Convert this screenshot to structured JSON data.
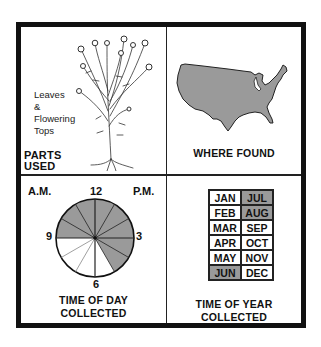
{
  "panels": {
    "parts_used": {
      "title_line1": "PARTS",
      "title_line2": "USED",
      "parts_line1": "Leaves",
      "parts_line2": "&",
      "parts_line3": "Flowering",
      "parts_line4": "Tops",
      "illustration": "flowering-plant-with-roots"
    },
    "where_found": {
      "title": "WHERE FOUND",
      "map": "contiguous-united-states",
      "map_fill": "#9a9a9a"
    },
    "time_of_day": {
      "title_line1": "TIME OF DAY",
      "title_line2": "COLLECTED",
      "am_label": "A.M.",
      "pm_label": "P.M.",
      "clock_labels": {
        "top": "12",
        "right": "3",
        "bottom": "6",
        "left": "9"
      },
      "shaded_from_hour": 9,
      "shaded_to_hour": 17,
      "shade_color": "#9a9a9a"
    },
    "time_of_year": {
      "title_line1": "TIME OF YEAR",
      "title_line2": "COLLECTED",
      "months": [
        {
          "label": "JAN",
          "shaded": false
        },
        {
          "label": "JUL",
          "shaded": true
        },
        {
          "label": "FEB",
          "shaded": false
        },
        {
          "label": "AUG",
          "shaded": true
        },
        {
          "label": "MAR",
          "shaded": false
        },
        {
          "label": "SEP",
          "shaded": false
        },
        {
          "label": "APR",
          "shaded": false
        },
        {
          "label": "OCT",
          "shaded": false
        },
        {
          "label": "MAY",
          "shaded": false
        },
        {
          "label": "NOV",
          "shaded": false
        },
        {
          "label": "JUN",
          "shaded": true
        },
        {
          "label": "DEC",
          "shaded": false
        }
      ]
    }
  }
}
